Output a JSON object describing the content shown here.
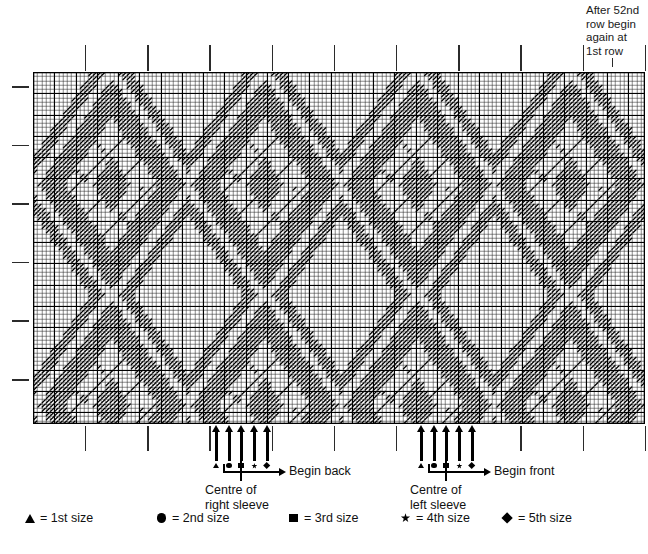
{
  "top_note": {
    "text": "After 52nd\nrow begin\nagain at\n1st row",
    "tick": "note-pointer-tick"
  },
  "chart": {
    "title": "argyle-knitting-pattern-chart",
    "cell_px": 4.25,
    "cols": 144,
    "rows": 83,
    "grid_color": "#111111",
    "stitch_color": "#000000",
    "background": "#ffffff",
    "major_every": 5,
    "top_ticks_count": 10,
    "left_ticks_count": 6
  },
  "chart_data": {
    "type": "heatmap",
    "xlabel": "",
    "ylabel": "",
    "cols": 144,
    "rows": 83,
    "motif_width": 36,
    "motif_height": 52,
    "cell_size_px": 4.25,
    "legend_position": "bottom",
    "grid": true,
    "note": "Diagonal stitch marks form repeating argyle lattice; repeat restarts after the 52nd row."
  },
  "markers": {
    "right_sleeve": {
      "centre_label": "Centre of\nright sleeve",
      "begin_label": "Begin back",
      "arrows": [
        {
          "size": "1st size",
          "symbol": "triangle"
        },
        {
          "size": "2nd size",
          "symbol": "circle"
        },
        {
          "size": "3rd size",
          "symbol": "square"
        },
        {
          "size": "4th size",
          "symbol": "star"
        },
        {
          "size": "5th size",
          "symbol": "diamond"
        }
      ]
    },
    "left_sleeve": {
      "centre_label": "Centre of\nleft sleeve",
      "begin_label": "Begin front",
      "arrows": [
        {
          "size": "1st size",
          "symbol": "triangle"
        },
        {
          "size": "2nd size",
          "symbol": "circle"
        },
        {
          "size": "3rd size",
          "symbol": "square"
        },
        {
          "size": "4th size",
          "symbol": "star"
        },
        {
          "size": "5th size",
          "symbol": "diamond"
        }
      ]
    }
  },
  "legend": {
    "items": [
      {
        "symbol": "triangle",
        "label": "= 1st size"
      },
      {
        "symbol": "circle",
        "label": "= 2nd size"
      },
      {
        "symbol": "square",
        "label": "= 3rd size"
      },
      {
        "symbol": "star",
        "label": "= 4th size"
      },
      {
        "symbol": "diamond",
        "label": "= 5th size"
      }
    ]
  }
}
